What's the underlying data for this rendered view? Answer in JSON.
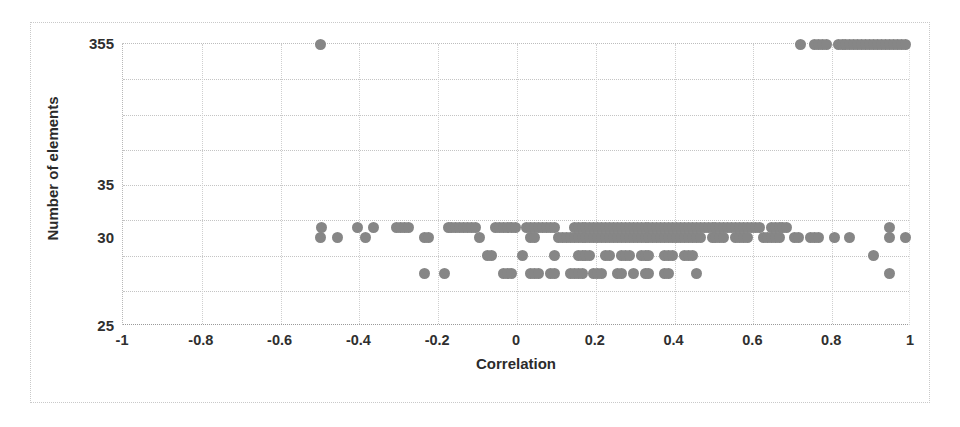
{
  "chart_data": {
    "type": "scatter",
    "title": "",
    "xlabel": "Correlation",
    "ylabel": "Number of elements",
    "xlim": [
      -1,
      1
    ],
    "xticks": [
      -1,
      -0.8,
      -0.6,
      -0.4,
      -0.2,
      0,
      0.2,
      0.4,
      0.6,
      0.8,
      1
    ],
    "xticklabels": [
      "-1",
      "-0.8",
      "-0.6",
      "-0.4",
      "-0.2",
      "0",
      "0.2",
      "0.4",
      "0.6",
      "0.8",
      "1"
    ],
    "yticklabels": [
      "355",
      "35",
      "30",
      "25"
    ],
    "y_axis_note": "Broken / non-linear axis: 8 equal bands between 25 and 355. Labeled ticks at 355 (top), 35, 30 and 25 (bottom).",
    "y_tick_fractions": [
      0.0,
      0.5,
      0.6875,
      1.0
    ],
    "grid": "dotted both axes",
    "legend": "none",
    "marker": {
      "shape": "circle",
      "color": "#868686",
      "size_px": 11
    },
    "series": [
      {
        "name": "Number of elements vs Correlation",
        "points": [
          [
            -0.5,
            355
          ],
          [
            -0.5,
            30
          ],
          [
            0.72,
            355
          ],
          [
            0.755,
            355
          ],
          [
            0.765,
            355
          ],
          [
            0.775,
            355
          ],
          [
            0.785,
            355
          ],
          [
            0.815,
            355
          ],
          [
            0.825,
            355
          ],
          [
            0.835,
            355
          ],
          [
            0.845,
            355
          ],
          [
            0.855,
            355
          ],
          [
            0.865,
            355
          ],
          [
            0.875,
            355
          ],
          [
            0.885,
            355
          ],
          [
            0.895,
            355
          ],
          [
            0.905,
            355
          ],
          [
            0.915,
            355
          ],
          [
            0.925,
            355
          ],
          [
            0.935,
            355
          ],
          [
            0.945,
            355
          ],
          [
            0.955,
            355
          ],
          [
            0.965,
            355
          ],
          [
            0.975,
            355
          ],
          [
            0.985,
            355
          ],
          [
            -0.495,
            31
          ],
          [
            -0.405,
            31
          ],
          [
            -0.365,
            31
          ],
          [
            -0.305,
            31
          ],
          [
            -0.295,
            31
          ],
          [
            -0.285,
            31
          ],
          [
            -0.275,
            31
          ],
          [
            -0.175,
            31
          ],
          [
            -0.165,
            31
          ],
          [
            -0.155,
            31
          ],
          [
            -0.145,
            31
          ],
          [
            -0.135,
            31
          ],
          [
            -0.125,
            31
          ],
          [
            -0.115,
            31
          ],
          [
            -0.105,
            31
          ],
          [
            -0.055,
            31
          ],
          [
            -0.045,
            31
          ],
          [
            -0.035,
            31
          ],
          [
            -0.025,
            31
          ],
          [
            -0.015,
            31
          ],
          [
            -0.005,
            31
          ],
          [
            0.025,
            31
          ],
          [
            0.035,
            31
          ],
          [
            0.045,
            31
          ],
          [
            0.055,
            31
          ],
          [
            0.065,
            31
          ],
          [
            0.075,
            31
          ],
          [
            0.085,
            31
          ],
          [
            0.095,
            31
          ],
          [
            0.145,
            31
          ],
          [
            0.155,
            31
          ],
          [
            0.165,
            31
          ],
          [
            0.175,
            31
          ],
          [
            0.185,
            31
          ],
          [
            0.195,
            31
          ],
          [
            0.205,
            31
          ],
          [
            0.215,
            31
          ],
          [
            0.225,
            31
          ],
          [
            0.235,
            31
          ],
          [
            0.245,
            31
          ],
          [
            0.255,
            31
          ],
          [
            0.265,
            31
          ],
          [
            0.275,
            31
          ],
          [
            0.285,
            31
          ],
          [
            0.295,
            31
          ],
          [
            0.305,
            31
          ],
          [
            0.315,
            31
          ],
          [
            0.325,
            31
          ],
          [
            0.335,
            31
          ],
          [
            0.345,
            31
          ],
          [
            0.355,
            31
          ],
          [
            0.365,
            31
          ],
          [
            0.375,
            31
          ],
          [
            0.385,
            31
          ],
          [
            0.395,
            31
          ],
          [
            0.405,
            31
          ],
          [
            0.415,
            31
          ],
          [
            0.425,
            31
          ],
          [
            0.435,
            31
          ],
          [
            0.445,
            31
          ],
          [
            0.455,
            31
          ],
          [
            0.465,
            31
          ],
          [
            0.475,
            31
          ],
          [
            0.485,
            31
          ],
          [
            0.495,
            31
          ],
          [
            0.505,
            31
          ],
          [
            0.515,
            31
          ],
          [
            0.525,
            31
          ],
          [
            0.535,
            31
          ],
          [
            0.545,
            31
          ],
          [
            0.555,
            31
          ],
          [
            0.565,
            31
          ],
          [
            0.575,
            31
          ],
          [
            0.585,
            31
          ],
          [
            0.595,
            31
          ],
          [
            0.605,
            31
          ],
          [
            0.615,
            31
          ],
          [
            0.645,
            31
          ],
          [
            0.655,
            31
          ],
          [
            0.665,
            31
          ],
          [
            0.675,
            31
          ],
          [
            0.685,
            31
          ],
          [
            0.945,
            31
          ],
          [
            -0.455,
            30
          ],
          [
            -0.385,
            30
          ],
          [
            -0.235,
            30
          ],
          [
            -0.225,
            30
          ],
          [
            -0.095,
            30
          ],
          [
            0.035,
            30
          ],
          [
            0.045,
            30
          ],
          [
            0.105,
            30
          ],
          [
            0.115,
            30
          ],
          [
            0.125,
            30
          ],
          [
            0.135,
            30
          ],
          [
            0.145,
            30
          ],
          [
            0.155,
            30
          ],
          [
            0.165,
            30
          ],
          [
            0.175,
            30
          ],
          [
            0.185,
            30
          ],
          [
            0.195,
            30
          ],
          [
            0.205,
            30
          ],
          [
            0.215,
            30
          ],
          [
            0.225,
            30
          ],
          [
            0.235,
            30
          ],
          [
            0.245,
            30
          ],
          [
            0.255,
            30
          ],
          [
            0.265,
            30
          ],
          [
            0.275,
            30
          ],
          [
            0.285,
            30
          ],
          [
            0.295,
            30
          ],
          [
            0.305,
            30
          ],
          [
            0.315,
            30
          ],
          [
            0.325,
            30
          ],
          [
            0.335,
            30
          ],
          [
            0.345,
            30
          ],
          [
            0.355,
            30
          ],
          [
            0.365,
            30
          ],
          [
            0.375,
            30
          ],
          [
            0.385,
            30
          ],
          [
            0.395,
            30
          ],
          [
            0.405,
            30
          ],
          [
            0.415,
            30
          ],
          [
            0.425,
            30
          ],
          [
            0.435,
            30
          ],
          [
            0.445,
            30
          ],
          [
            0.455,
            30
          ],
          [
            0.465,
            30
          ],
          [
            0.495,
            30
          ],
          [
            0.505,
            30
          ],
          [
            0.515,
            30
          ],
          [
            0.525,
            30
          ],
          [
            0.555,
            30
          ],
          [
            0.565,
            30
          ],
          [
            0.575,
            30
          ],
          [
            0.585,
            30
          ],
          [
            0.625,
            30
          ],
          [
            0.635,
            30
          ],
          [
            0.645,
            30
          ],
          [
            0.655,
            30
          ],
          [
            0.665,
            30
          ],
          [
            0.705,
            30
          ],
          [
            0.715,
            30
          ],
          [
            0.745,
            30
          ],
          [
            0.755,
            30
          ],
          [
            0.765,
            30
          ],
          [
            0.805,
            30
          ],
          [
            0.845,
            30
          ],
          [
            0.945,
            30
          ],
          [
            0.985,
            30
          ],
          [
            -0.075,
            29
          ],
          [
            -0.065,
            29
          ],
          [
            0.015,
            29
          ],
          [
            0.095,
            29
          ],
          [
            0.155,
            29
          ],
          [
            0.165,
            29
          ],
          [
            0.175,
            29
          ],
          [
            0.185,
            29
          ],
          [
            0.225,
            29
          ],
          [
            0.235,
            29
          ],
          [
            0.265,
            29
          ],
          [
            0.275,
            29
          ],
          [
            0.285,
            29
          ],
          [
            0.315,
            29
          ],
          [
            0.325,
            29
          ],
          [
            0.335,
            29
          ],
          [
            0.375,
            29
          ],
          [
            0.385,
            29
          ],
          [
            0.395,
            29
          ],
          [
            0.425,
            29
          ],
          [
            0.435,
            29
          ],
          [
            0.445,
            29
          ],
          [
            0.905,
            29
          ],
          [
            -0.235,
            28
          ],
          [
            -0.185,
            28
          ],
          [
            -0.035,
            28
          ],
          [
            -0.025,
            28
          ],
          [
            -0.015,
            28
          ],
          [
            0.035,
            28
          ],
          [
            0.045,
            28
          ],
          [
            0.055,
            28
          ],
          [
            0.085,
            28
          ],
          [
            0.095,
            28
          ],
          [
            0.135,
            28
          ],
          [
            0.145,
            28
          ],
          [
            0.155,
            28
          ],
          [
            0.165,
            28
          ],
          [
            0.195,
            28
          ],
          [
            0.205,
            28
          ],
          [
            0.215,
            28
          ],
          [
            0.255,
            28
          ],
          [
            0.265,
            28
          ],
          [
            0.295,
            28
          ],
          [
            0.325,
            28
          ],
          [
            0.335,
            28
          ],
          [
            0.375,
            28
          ],
          [
            0.385,
            28
          ],
          [
            0.455,
            28
          ],
          [
            0.945,
            28
          ]
        ]
      }
    ]
  }
}
